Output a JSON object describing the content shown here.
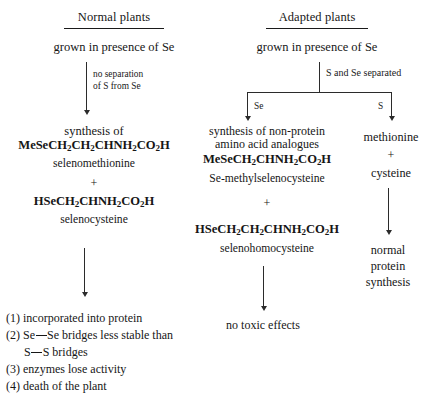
{
  "diagram": {
    "title_left": "Normal plants",
    "title_right": "Adapted plants",
    "left": {
      "condition": "grown in presence of Se",
      "edge_label_line1": "no separation",
      "edge_label_line2": "of S from Se",
      "synthesis_label": "synthesis of",
      "formula_1": "MeSeCH2CH2CHNH2CO2H",
      "compound_1": "selenomethionine",
      "plus": "+",
      "formula_2": "HSeCH2CHNH2CO2H",
      "compound_2": "selenocysteine",
      "outcomes": [
        {
          "num": "(1)",
          "text": "incorporated into protein",
          "cont": ""
        },
        {
          "num": "(2)",
          "text": "Se—Se bridges less stable than",
          "cont": "S—S bridges"
        },
        {
          "num": "(3)",
          "text": "enzymes lose activity",
          "cont": ""
        },
        {
          "num": "(4)",
          "text": "death of the plant",
          "cont": ""
        }
      ]
    },
    "right": {
      "condition": "grown in presence of Se",
      "split_label": "S and Se separated",
      "branch_se_label": "Se",
      "branch_s_label": "S",
      "middle": {
        "synthesis_line1": "synthesis of non-protein",
        "synthesis_line2": "amino acid analogues",
        "formula_1": "MeSeCH2CHNH2CO2H",
        "compound_1": "Se-methylselenocysteine",
        "plus": "+",
        "formula_2": "HSeCH2CH2CHNH2CO2H",
        "compound_2": "selenohomocysteine",
        "result": "no toxic effects"
      },
      "far": {
        "product_1": "methionine",
        "plus": "+",
        "product_2": "cysteine",
        "result_line1": "normal",
        "result_line2": "protein",
        "result_line3": "synthesis"
      }
    }
  },
  "colors": {
    "ink": "#161616",
    "line": "#2b2b2b",
    "background": "#ffffff"
  }
}
